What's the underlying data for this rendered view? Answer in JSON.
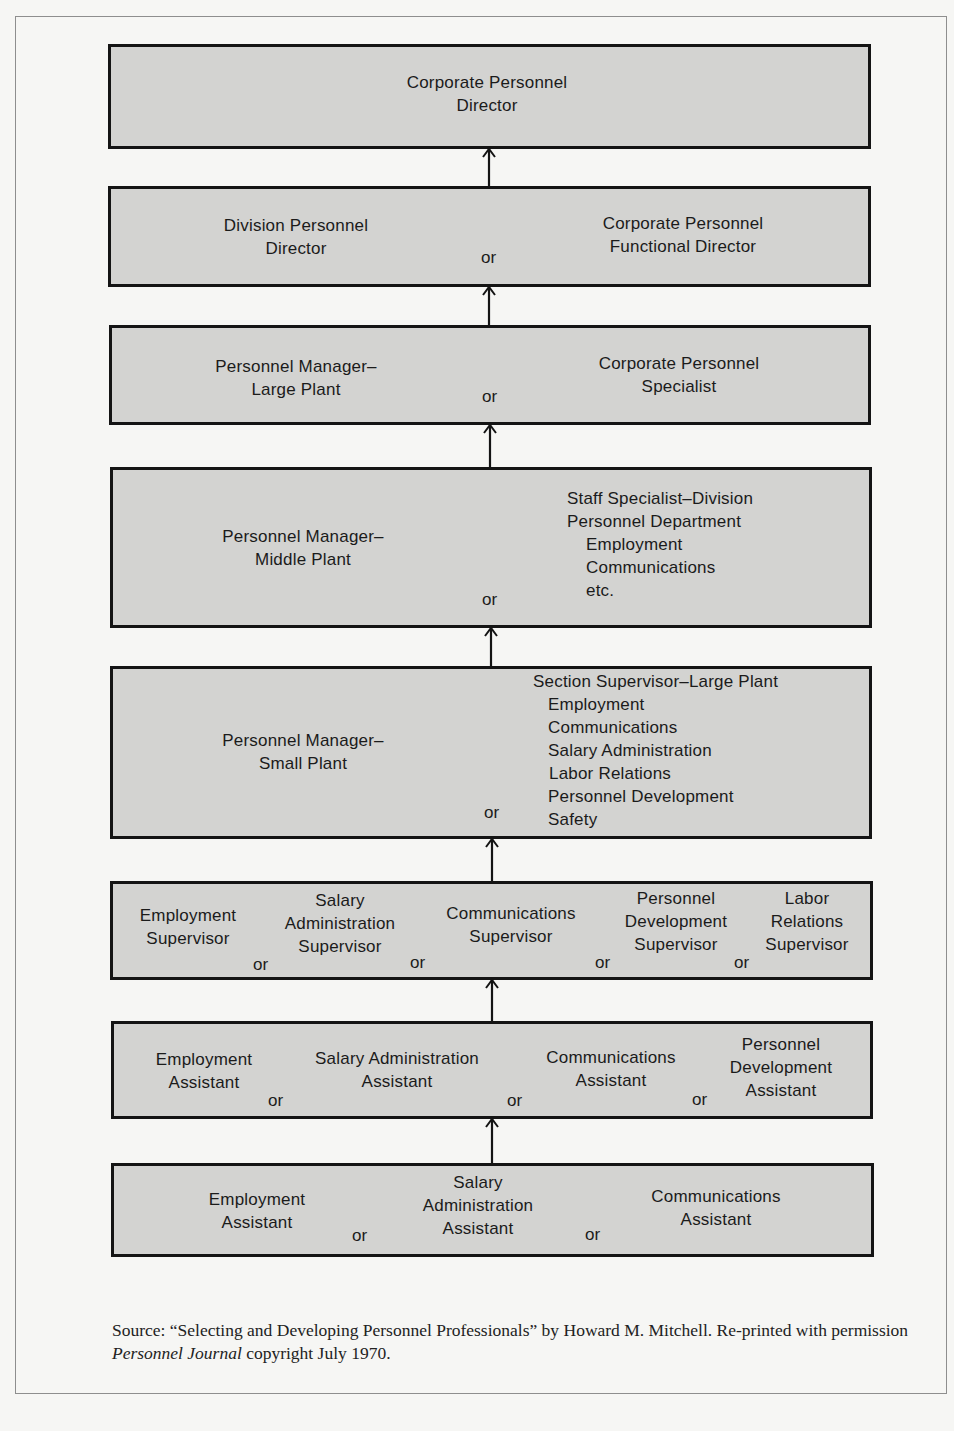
{
  "diagram": {
    "type": "career-ladder",
    "levels": [
      {
        "id": 1,
        "positions": [
          {
            "lines": [
              "Corporate Personnel",
              "Director"
            ]
          }
        ]
      },
      {
        "id": 2,
        "positions": [
          {
            "lines": [
              "Division Personnel",
              "Director"
            ]
          },
          {
            "lines": [
              "Corporate Personnel",
              "Functional Director"
            ]
          }
        ],
        "connectors": [
          "or"
        ]
      },
      {
        "id": 3,
        "positions": [
          {
            "lines": [
              "Personnel Manager–",
              "Large Plant"
            ]
          },
          {
            "lines": [
              "Corporate Personnel",
              "Specialist"
            ]
          }
        ],
        "connectors": [
          "or"
        ]
      },
      {
        "id": 4,
        "positions": [
          {
            "lines": [
              "Personnel Manager–",
              "Middle Plant"
            ]
          },
          {
            "lines": [
              "Staff Specialist–Division",
              "Personnel Department",
              "Employment",
              "Communications",
              "etc."
            ]
          }
        ],
        "connectors": [
          "or"
        ]
      },
      {
        "id": 5,
        "positions": [
          {
            "lines": [
              "Personnel Manager–",
              "Small Plant"
            ]
          },
          {
            "lines": [
              "Section Supervisor–Large Plant",
              "Employment",
              "Communications",
              "Salary Administration",
              "Labor Relations",
              "Personnel Development",
              "Safety"
            ]
          }
        ],
        "connectors": [
          "or"
        ]
      },
      {
        "id": 6,
        "positions": [
          {
            "lines": [
              "Employment",
              "Supervisor"
            ]
          },
          {
            "lines": [
              "Salary",
              "Administration",
              "Supervisor"
            ]
          },
          {
            "lines": [
              "Communications",
              "Supervisor"
            ]
          },
          {
            "lines": [
              "Personnel",
              "Development",
              "Supervisor"
            ]
          },
          {
            "lines": [
              "Labor",
              "Relations",
              "Supervisor"
            ]
          }
        ],
        "connectors": [
          "or",
          "or",
          "or",
          "or"
        ]
      },
      {
        "id": 7,
        "positions": [
          {
            "lines": [
              "Employment",
              "Assistant"
            ]
          },
          {
            "lines": [
              "Salary Administration",
              "Assistant"
            ]
          },
          {
            "lines": [
              "Communications",
              "Assistant"
            ]
          },
          {
            "lines": [
              "Personnel",
              "Development",
              "Assistant"
            ]
          }
        ],
        "connectors": [
          "or",
          "or",
          "or"
        ]
      },
      {
        "id": 8,
        "positions": [
          {
            "lines": [
              "Employment",
              "Assistant"
            ]
          },
          {
            "lines": [
              "Salary",
              "Administration",
              "Assistant"
            ]
          },
          {
            "lines": [
              "Communications",
              "Assistant"
            ]
          }
        ],
        "connectors": [
          "or",
          "or"
        ]
      }
    ],
    "arrow_icon": "arrow-up-icon",
    "colors": {
      "box_fill": "#d3d3d1",
      "box_border": "#141414",
      "page": "#f6f6f4",
      "frame": "#8e8e8e"
    }
  },
  "source": {
    "prefix": "Source: “Selecting and Developing Personnel Professionals” by Howard M. Mitchell. Re-printed with permission ",
    "journal": "Personnel Journal",
    "suffix": " copyright July 1970."
  }
}
